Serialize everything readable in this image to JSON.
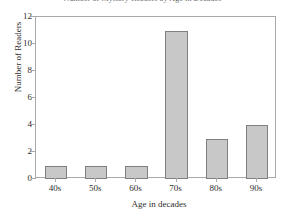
{
  "chart_data": {
    "type": "bar",
    "title": "Number of Mystery Readers by Age in Decades",
    "xlabel": "Age in decades",
    "ylabel": "Number of Readers",
    "categories": [
      "40s",
      "50s",
      "60s",
      "70s",
      "80s",
      "90s"
    ],
    "values": [
      1,
      1,
      1,
      11,
      3,
      4
    ],
    "ylim": [
      0,
      12
    ],
    "yticks": [
      0,
      2,
      4,
      6,
      8,
      10,
      12
    ],
    "ytick_labels": [
      "0",
      "2",
      "4",
      "6",
      "8",
      "10",
      "12"
    ],
    "grid": false,
    "legend": null,
    "bar_color": "#c8c8c8",
    "bar_border_color": "#808080",
    "axis_color": "#a9a9a9",
    "text_color": "#2e2e2e",
    "background": "#ffffff"
  }
}
